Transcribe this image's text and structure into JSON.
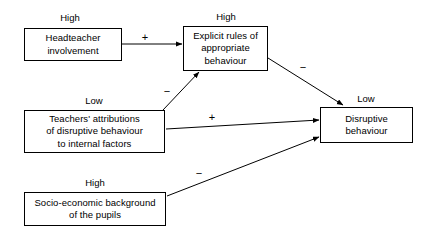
{
  "diagram": {
    "canvas": {
      "width": 438,
      "height": 238,
      "background": "#ffffff"
    },
    "line_color": "#000000",
    "nodes": [
      {
        "id": "headteacher",
        "label": "Headteacher\ninvolvement",
        "level": "High",
        "x": 24,
        "y": 28,
        "w": 98,
        "h": 33
      },
      {
        "id": "explicit-rules",
        "label": "Explicit rules of\nappropriate\nbehaviour",
        "level": "High",
        "x": 183,
        "y": 26,
        "w": 85,
        "h": 45
      },
      {
        "id": "teachers-attributions",
        "label": "Teachers' attributions\nof disruptive behaviour\nto internal factors",
        "level": "Low",
        "x": 24,
        "y": 110,
        "w": 141,
        "h": 43
      },
      {
        "id": "disruptive-behaviour",
        "label": "Disruptive\nbehaviour",
        "level": "Low",
        "x": 320,
        "y": 107,
        "w": 93,
        "h": 36
      },
      {
        "id": "socio-economic",
        "label": "Socio-economic background\nof the pupils",
        "level": "High",
        "x": 24,
        "y": 192,
        "w": 142,
        "h": 34
      }
    ],
    "level_labels": [
      {
        "id": "level-headteacher",
        "text": "High",
        "x": 70,
        "y": 12
      },
      {
        "id": "level-explicit-rules",
        "text": "High",
        "x": 226,
        "y": 11
      },
      {
        "id": "level-teachers",
        "text": "Low",
        "x": 94,
        "y": 95
      },
      {
        "id": "level-disruptive",
        "text": "Low",
        "x": 366,
        "y": 93
      },
      {
        "id": "level-socio",
        "text": "High",
        "x": 95,
        "y": 177
      }
    ],
    "edges": [
      {
        "id": "headteacher-to-explicit-rules",
        "from": "headteacher",
        "to": "explicit-rules",
        "sign": "+",
        "sign_x": 145,
        "sign_y": 32,
        "x1": 122,
        "y1": 44,
        "x2": 182,
        "y2": 44
      },
      {
        "id": "teachers-to-explicit-rules",
        "from": "teachers-attributions",
        "to": "explicit-rules",
        "sign": "−",
        "sign_x": 167,
        "sign_y": 86,
        "x1": 163,
        "y1": 110,
        "x2": 199,
        "y2": 72
      },
      {
        "id": "explicit-rules-to-disruptive",
        "from": "explicit-rules",
        "to": "disruptive-behaviour",
        "sign": "−",
        "sign_x": 303,
        "sign_y": 62,
        "x1": 268,
        "y1": 58,
        "x2": 343,
        "y2": 105
      },
      {
        "id": "teachers-to-disruptive",
        "from": "teachers-attributions",
        "to": "disruptive-behaviour",
        "sign": "+",
        "sign_x": 212,
        "sign_y": 112,
        "x1": 166,
        "y1": 129,
        "x2": 319,
        "y2": 120
      },
      {
        "id": "socio-to-disruptive",
        "from": "socio-economic",
        "to": "disruptive-behaviour",
        "sign": "−",
        "sign_x": 199,
        "sign_y": 168,
        "x1": 167,
        "y1": 196,
        "x2": 319,
        "y2": 137
      }
    ]
  }
}
